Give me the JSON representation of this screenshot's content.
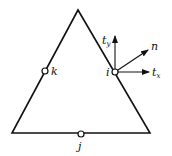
{
  "diagram": {
    "triangle": {
      "apex": [
        78,
        10
      ],
      "bottom_left": [
        12,
        133
      ],
      "bottom_right": [
        150,
        133
      ]
    },
    "nodes": [
      {
        "id": "k",
        "label": "k",
        "x": 45,
        "y": 71
      },
      {
        "id": "i",
        "label": "i",
        "x": 115,
        "y": 72
      },
      {
        "id": "j",
        "label": "j",
        "x": 81,
        "y": 134
      }
    ],
    "vectors": [
      {
        "id": "ty",
        "label": "t",
        "subscript": "y",
        "to": [
          115,
          36
        ]
      },
      {
        "id": "n",
        "label": "n",
        "to": [
          148,
          50
        ]
      },
      {
        "id": "tx",
        "label": "t",
        "subscript": "x",
        "to": [
          149,
          72
        ]
      }
    ],
    "color": "#111111"
  }
}
